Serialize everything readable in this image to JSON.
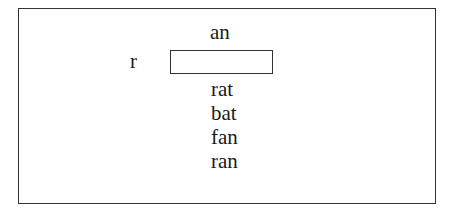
{
  "exercise": {
    "word_family": "an",
    "onset": "r",
    "blank_value": "",
    "choices": [
      "rat",
      "bat",
      "fan",
      "ran"
    ]
  }
}
